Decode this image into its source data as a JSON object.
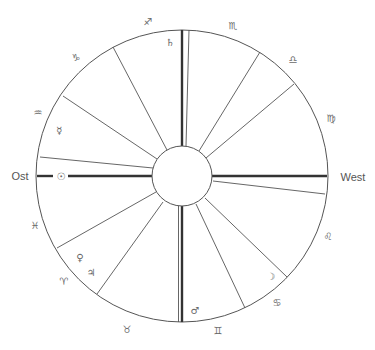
{
  "diagram": {
    "type": "horoscope-chart",
    "directions": {
      "east": "Ost",
      "west": "West"
    },
    "signs": [
      {
        "name": "sagittarius",
        "glyph": "♐"
      },
      {
        "name": "scorpio",
        "glyph": "♏"
      },
      {
        "name": "libra",
        "glyph": "♎"
      },
      {
        "name": "virgo",
        "glyph": "♍"
      },
      {
        "name": "leo",
        "glyph": "♌"
      },
      {
        "name": "cancer",
        "glyph": "♋"
      },
      {
        "name": "gemini",
        "glyph": "♊"
      },
      {
        "name": "taurus",
        "glyph": "♉"
      },
      {
        "name": "aries",
        "glyph": "♈"
      },
      {
        "name": "pisces",
        "glyph": "♓"
      },
      {
        "name": "aquarius",
        "glyph": "♒"
      },
      {
        "name": "capricorn",
        "glyph": "♑"
      }
    ],
    "planets": [
      {
        "name": "saturn",
        "glyph": "♄"
      },
      {
        "name": "mercury",
        "glyph": "☿"
      },
      {
        "name": "sun",
        "glyph": "☉"
      },
      {
        "name": "venus",
        "glyph": "♀"
      },
      {
        "name": "jupiter",
        "glyph": "♃"
      },
      {
        "name": "mars",
        "glyph": "♂"
      },
      {
        "name": "moon",
        "glyph": "☽"
      }
    ],
    "colors": {
      "line": "#555555",
      "axis": "#333333",
      "text": "#666666"
    }
  }
}
